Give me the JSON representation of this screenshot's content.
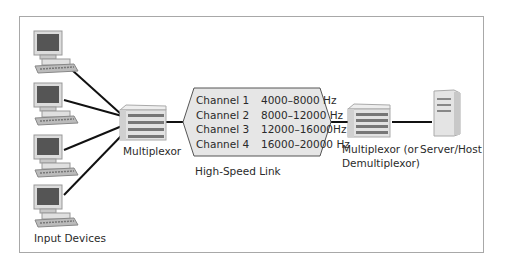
{
  "diagram": {
    "input_devices": {
      "label": "Input Devices",
      "count": 4
    },
    "left_mux": {
      "label": "Multiplexor"
    },
    "link": {
      "label": "High-Speed Link",
      "channels": [
        {
          "name": "Channel 1",
          "range": "4000–8000 Hz"
        },
        {
          "name": "Channel 2",
          "range": "8000–12000 Hz"
        },
        {
          "name": "Channel 3",
          "range": "12000–16000Hz"
        },
        {
          "name": "Channel 4",
          "range": "16000–20000 Hz"
        }
      ],
      "fill_color": "#e6e6e6",
      "border_color": "#555555"
    },
    "right_mux": {
      "label_line1": "Multiplexor (or",
      "label_line2": "Demultiplexor)"
    },
    "server": {
      "label": "Server/Host"
    }
  }
}
